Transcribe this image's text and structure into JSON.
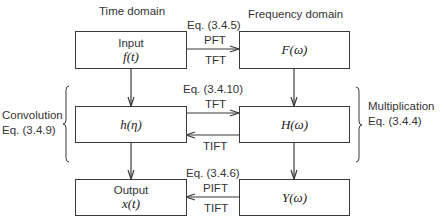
{
  "headers": {
    "time_domain": "Time domain",
    "frequency_domain": "Frequency domain"
  },
  "boxes": {
    "input": {
      "line1": "Input",
      "line2": "f(t)"
    },
    "impulse_response": {
      "line1": "h(η)"
    },
    "output": {
      "line1": "Output",
      "line2": "x(t)"
    },
    "freq_input": {
      "line1": "F(ω)"
    },
    "transfer_function": {
      "line1": "H(ω)"
    },
    "freq_output": {
      "line1": "Y(ω)"
    }
  },
  "arrows": {
    "top": {
      "eq": "Eq. (3.4.5)",
      "above": "PFT",
      "below": "TFT",
      "direction": "right"
    },
    "middle": {
      "eq": "Eq. (3.4.10)",
      "above": "TFT",
      "below": "TIFT",
      "directions": [
        "right",
        "left"
      ]
    },
    "bottom": {
      "eq": "Eq. (3.4.6)",
      "above": "PIFT",
      "below": "TIFT",
      "direction": "left"
    }
  },
  "braces": {
    "left": {
      "line1": "Convolution",
      "line2": "Eq. (3.4.9)"
    },
    "right": {
      "line1": "Multiplication",
      "line2": "Eq. (3.4.4)"
    }
  },
  "colors": {
    "line": "#3a3a3a",
    "text": "#333333",
    "background": "#ffffff"
  }
}
